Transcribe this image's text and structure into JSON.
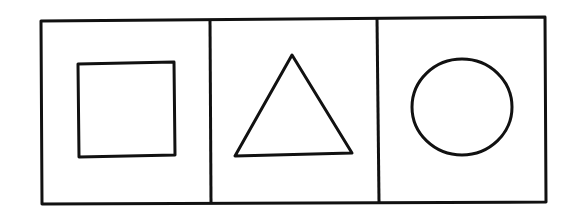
{
  "diagram": {
    "stroke_color": "#111111",
    "background_color": "#ffffff",
    "panels": [
      {
        "index": 0,
        "shape": "square",
        "label": "square-shape"
      },
      {
        "index": 1,
        "shape": "triangle",
        "label": "triangle-shape"
      },
      {
        "index": 2,
        "shape": "circle",
        "label": "circle-shape"
      }
    ]
  }
}
